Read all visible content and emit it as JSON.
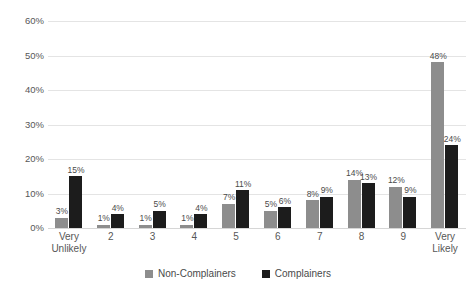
{
  "chart_data": {
    "type": "bar",
    "title": "",
    "subtitle": "",
    "xlabel": "",
    "ylabel": "",
    "ylim": [
      0,
      60
    ],
    "ytick_labels": [
      "0%",
      "10%",
      "20%",
      "30%",
      "40%",
      "50%",
      "60%"
    ],
    "ytick_values": [
      0,
      10,
      20,
      30,
      40,
      50,
      60
    ],
    "grid": true,
    "legend_position": "bottom-center",
    "categories": [
      "Very Unlikely",
      "2",
      "3",
      "4",
      "5",
      "6",
      "7",
      "8",
      "9",
      "Very Likely"
    ],
    "category_lines": [
      [
        "Very",
        "Unlikely"
      ],
      [
        "2"
      ],
      [
        "3"
      ],
      [
        "4"
      ],
      [
        "5"
      ],
      [
        "6"
      ],
      [
        "7"
      ],
      [
        "8"
      ],
      [
        "9"
      ],
      [
        "Very",
        "Likely"
      ]
    ],
    "series": [
      {
        "name": "Non-Complainers",
        "color": "#8d8d8d",
        "values": [
          3,
          1,
          1,
          1,
          7,
          5,
          8,
          14,
          12,
          48
        ],
        "labels": [
          "3%",
          "1%",
          "1%",
          "1%",
          "7%",
          "5%",
          "8%",
          "14%",
          "12%",
          "48%"
        ]
      },
      {
        "name": "Complainers",
        "color": "#1c1c1c",
        "values": [
          15,
          4,
          5,
          4,
          11,
          6,
          9,
          13,
          9,
          24
        ],
        "labels": [
          "15%",
          "4%",
          "5%",
          "4%",
          "11%",
          "6%",
          "9%",
          "13%",
          "9%",
          "24%"
        ]
      }
    ]
  },
  "legend": {
    "items": [
      {
        "label": "Non-Complainers",
        "color": "#8d8d8d"
      },
      {
        "label": "Complainers",
        "color": "#1c1c1c"
      }
    ]
  }
}
